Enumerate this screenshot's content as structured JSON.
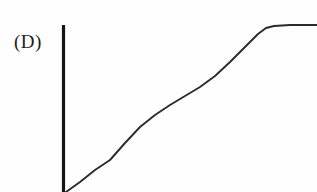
{
  "figure": {
    "panel_label": "(D)",
    "background_color": "#fefefe",
    "axis_color": "#151515",
    "curve_color": "#2b2b2b"
  },
  "chart_data": {
    "type": "line",
    "title": "(D)",
    "xlabel": "",
    "ylabel": "",
    "grid": false,
    "legend": null,
    "axes": {
      "y_axis_visible": true,
      "x_axis_visible": false,
      "y_axis_x_px": 63,
      "y_axis_top_px": 25,
      "y_axis_bottom_px": 192,
      "xlim": [
        63,
        317
      ],
      "ylim": [
        192,
        25
      ]
    },
    "series": [
      {
        "name": "curve",
        "points_px": [
          [
            66,
            192
          ],
          [
            80,
            182
          ],
          [
            95,
            170
          ],
          [
            110,
            160
          ],
          [
            125,
            143
          ],
          [
            140,
            127
          ],
          [
            155,
            115
          ],
          [
            170,
            105
          ],
          [
            185,
            96
          ],
          [
            200,
            87
          ],
          [
            215,
            76
          ],
          [
            230,
            62
          ],
          [
            240,
            52
          ],
          [
            250,
            42
          ],
          [
            258,
            34
          ],
          [
            266,
            28
          ],
          [
            274,
            26
          ],
          [
            290,
            25
          ],
          [
            317,
            25
          ]
        ]
      }
    ],
    "annotations": [
      {
        "text": "(D)",
        "x_px": 16,
        "y_px": 46,
        "role": "panel-label"
      }
    ]
  }
}
